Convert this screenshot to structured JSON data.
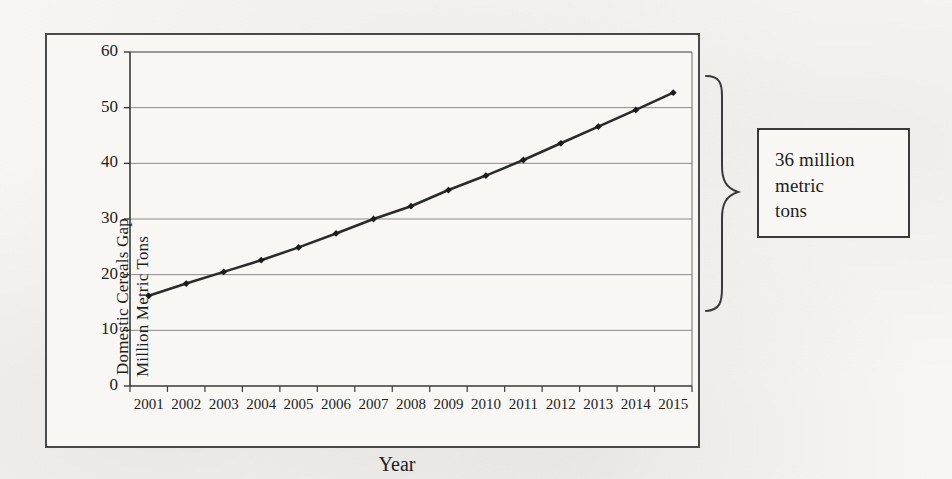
{
  "chart_data": {
    "type": "line",
    "title": "",
    "subtitle": "",
    "xlabel": "Year",
    "ylabel": "Domestic Cereals Gap\nMillion Metric Tons",
    "ylabel_line1": "Domestic Cereals Gap",
    "ylabel_line2": "Million Metric Tons",
    "categories": [
      "2001",
      "2002",
      "2003",
      "2004",
      "2005",
      "2006",
      "2007",
      "2008",
      "2009",
      "2010",
      "2011",
      "2012",
      "2013",
      "2014",
      "2015"
    ],
    "values": [
      16.2,
      18.4,
      20.5,
      22.6,
      24.9,
      27.4,
      30.0,
      32.3,
      35.2,
      37.8,
      40.6,
      43.6,
      46.6,
      49.6,
      52.7
    ],
    "series": [
      {
        "name": "Domestic Cereals Gap",
        "values": [
          16.2,
          18.4,
          20.5,
          22.6,
          24.9,
          27.4,
          30.0,
          32.3,
          35.2,
          37.8,
          40.6,
          43.6,
          46.6,
          49.6,
          52.7
        ]
      }
    ],
    "ylim": [
      0,
      60
    ],
    "yticks": [
      0,
      10,
      20,
      30,
      40,
      50,
      60
    ],
    "ytick_labels": [
      "0",
      "10",
      "20",
      "30",
      "40",
      "50",
      "60"
    ],
    "grid": true,
    "grid_axis": "y",
    "legend": false,
    "legend_position": "none",
    "marker": "diamond",
    "line_color": "#2b2b2b",
    "marker_color": "#1a1a1a",
    "grid_color": "#8a8a8a",
    "axis_color": "#3a3a3a",
    "plot_background": "#f8f7f4",
    "annotations": [
      {
        "name": "gap-callout",
        "text_line1": "36 million",
        "text_line2": "metric",
        "text_line3": "tons",
        "full_text": "36 million metric tons",
        "value": 36,
        "unit": "million metric tons",
        "shape": "curly-brace",
        "brace_from_value": 16.2,
        "brace_to_value": 52.7
      }
    ]
  },
  "annotation_box": {
    "line1": "36 million",
    "line2": "metric",
    "line3": "tons"
  },
  "axes": {
    "x_title": "Year",
    "y_title_line1": "Domestic Cereals Gap",
    "y_title_line2": "Million Metric Tons"
  },
  "colors": {
    "page_background": "#f7f6f3",
    "frame_border": "#4a4a4a",
    "data_line": "#2b2b2b",
    "gridline": "#8a8a8a",
    "text": "#1d1d1d",
    "annotation_border": "#3a3a3a"
  }
}
